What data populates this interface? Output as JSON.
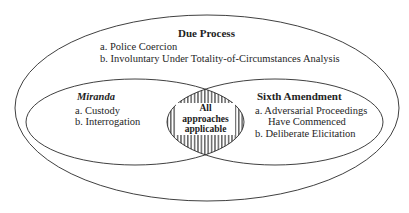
{
  "diagram": {
    "type": "venn",
    "outer_set": {
      "title": "Due Process",
      "items": [
        "a.  Police Coercion",
        "b.  Involuntary Under Totality-of-Circumstances Analysis"
      ]
    },
    "left_set": {
      "title": "Miranda",
      "items": [
        "a.  Custody",
        "b.  Interrogation"
      ]
    },
    "right_set": {
      "title": "Sixth Amendment",
      "items": [
        "a.  Adversarial Proceedings",
        "Have Commenced",
        "b.  Deliberate Elicitation"
      ]
    },
    "intersection": {
      "lines": [
        "All",
        "approaches",
        "applicable"
      ],
      "fill": "vertical-hatch"
    },
    "colors": {
      "stroke": "#2a2a2a",
      "background": "#ffffff",
      "hatch": "#2a2a2a"
    }
  }
}
